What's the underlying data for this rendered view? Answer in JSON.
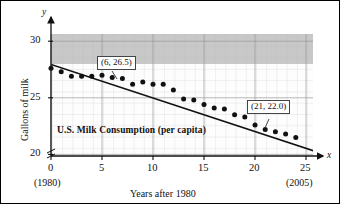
{
  "figure": {
    "inner_title": "U.S. Milk Consumption (per capita)",
    "xlabel": "Years after 1980",
    "ylabel": "Gallons of milk",
    "x_axis_var": "x",
    "y_axis_var": "y"
  },
  "annotations": [
    {
      "name": "callout-point-a",
      "text": "(6, 26.5)"
    },
    {
      "name": "callout-point-b",
      "text": "(21, 22.0)"
    }
  ],
  "axis": {
    "x_ticks": [
      "0",
      "5",
      "10",
      "15",
      "20",
      "25"
    ],
    "y_ticks": [
      "20",
      "25",
      "30"
    ],
    "x_sub_labels": [
      {
        "under": "0",
        "text": "(1980)"
      },
      {
        "under": "25",
        "text": "(2005)"
      }
    ]
  },
  "chart_data": {
    "type": "scatter",
    "title": "U.S. Milk Consumption (per capita)",
    "xlabel": "Years after 1980",
    "ylabel": "Gallons of milk",
    "xlim": [
      0,
      26
    ],
    "ylim": [
      20,
      31
    ],
    "xticks": [
      0,
      5,
      10,
      15,
      20,
      25
    ],
    "yticks": [
      20,
      25,
      30
    ],
    "grid": true,
    "y_axis_break": true,
    "legend": "none",
    "series": [
      {
        "name": "U.S. milk consumption (gallons per capita)",
        "type": "scatter",
        "x": [
          0,
          1,
          2,
          3,
          4,
          5,
          6,
          7,
          8,
          9,
          10,
          11,
          12,
          13,
          14,
          15,
          16,
          17,
          18,
          19,
          20,
          21,
          22,
          23,
          24
        ],
        "y": [
          27.6,
          27.3,
          26.9,
          26.9,
          26.9,
          27.0,
          26.8,
          26.7,
          26.2,
          26.4,
          26.2,
          26.2,
          25.7,
          24.9,
          24.8,
          24.4,
          24.1,
          24.0,
          23.5,
          23.3,
          22.6,
          22.2,
          22.0,
          21.8,
          21.5
        ]
      },
      {
        "name": "linear regression line",
        "type": "line",
        "x": [
          0,
          26
        ],
        "y": [
          28.0,
          20.3
        ],
        "slope": -0.296,
        "intercept": 28.0
      }
    ],
    "annotations": [
      {
        "text": "(6, 26.5)",
        "x": 6,
        "y": 26.5
      },
      {
        "text": "(21, 22.0)",
        "x": 21,
        "y": 22.0
      }
    ],
    "x_sub_tick_labels": {
      "0": "(1980)",
      "25": "(2005)"
    }
  }
}
